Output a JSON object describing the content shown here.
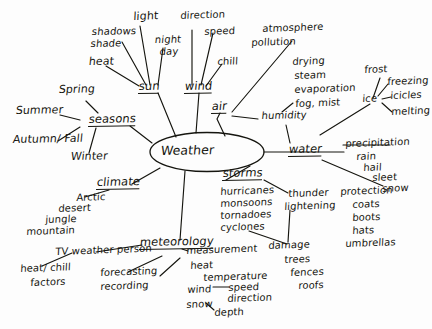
{
  "diagram": {
    "type": "mind-map",
    "title": "Weather",
    "style": "hand-drawn black ink on white paper",
    "center": {
      "label": "Weather",
      "shape": "ellipse"
    },
    "branches": [
      {
        "id": "sun",
        "label": "sun",
        "children": [
          {
            "id": "shadows-shade",
            "label": "shadows\nshade"
          },
          {
            "id": "light",
            "label": "light"
          },
          {
            "id": "night-day",
            "label": "night\nday"
          },
          {
            "id": "heat",
            "label": "heat"
          }
        ]
      },
      {
        "id": "wind",
        "label": "wind",
        "children": [
          {
            "id": "direction",
            "label": "direction"
          },
          {
            "id": "speed",
            "label": "speed"
          },
          {
            "id": "chill",
            "label": "chill"
          }
        ]
      },
      {
        "id": "air",
        "label": "air",
        "children": [
          {
            "id": "atmosphere-pollution",
            "label": "atmosphere\npollution"
          },
          {
            "id": "humidity",
            "label": "humidity"
          }
        ]
      },
      {
        "id": "water",
        "label": "water",
        "children": [
          {
            "id": "drying-steam-evaporation-fog",
            "label": "drying\nsteam\nevaporation\nfog, mist"
          },
          {
            "id": "ice",
            "label": "ice"
          },
          {
            "id": "frost",
            "label": "frost"
          },
          {
            "id": "freezing",
            "label": "freezing"
          },
          {
            "id": "icicles",
            "label": "icicles"
          },
          {
            "id": "melting",
            "label": "melting"
          },
          {
            "id": "precipitation",
            "label": "precipitation\nrain\nhail\nsleet\nsnow"
          },
          {
            "id": "protection",
            "label": "protection\ncoats\nboots\nhats\numbrellas"
          }
        ]
      },
      {
        "id": "storms",
        "label": "storms",
        "children": [
          {
            "id": "storm-types",
            "label": "hurricanes\nmonsoons\ntornadoes\ncyclones"
          },
          {
            "id": "thunder-lightening",
            "label": "thunder\nlightening"
          },
          {
            "id": "damage",
            "label": "damage\ntrees\nfences\nroofs"
          }
        ]
      },
      {
        "id": "seasons",
        "label": "seasons",
        "children": [
          {
            "id": "spring",
            "label": "Spring"
          },
          {
            "id": "summer",
            "label": "Summer"
          },
          {
            "id": "autumn-fall",
            "label": "Autumn/ Fall"
          },
          {
            "id": "winter",
            "label": "Winter"
          }
        ]
      },
      {
        "id": "climate",
        "label": "climate",
        "children": [
          {
            "id": "climate-types",
            "label": "Arctic\ndesert\njungle\nmountain"
          }
        ]
      },
      {
        "id": "meteorology",
        "label": "meteorology",
        "children": [
          {
            "id": "tv-weather-person",
            "label": "TV weather person"
          },
          {
            "id": "heat-chill-factors",
            "label": "heat/ chill\nfactors"
          },
          {
            "id": "forecasting-recording",
            "label": "forecasting\nrecording"
          },
          {
            "id": "measurement",
            "label": "measurement"
          },
          {
            "id": "measure-heat",
            "label": "heat"
          },
          {
            "id": "measure-temperature",
            "label": "temperature"
          },
          {
            "id": "measure-wind",
            "label": "wind"
          },
          {
            "id": "measure-speed",
            "label": "speed"
          },
          {
            "id": "measure-direction",
            "label": "direction"
          },
          {
            "id": "measure-snow",
            "label": "snow"
          },
          {
            "id": "measure-depth",
            "label": "depth"
          }
        ]
      }
    ],
    "labels": {
      "shadows": "shadows",
      "shade": "shade",
      "light": "light",
      "night": "night",
      "day": "day",
      "heat": "heat",
      "sun": "sun",
      "direction": "direction",
      "speed": "speed",
      "chill": "chill",
      "wind": "wind",
      "atmosphere": "atmosphere",
      "pollution": "pollution",
      "air": "air",
      "humidity": "humidity",
      "drying": "drying",
      "steam": "steam",
      "evaporation": "evaporation",
      "fog_mist": "fog, mist",
      "frost": "frost",
      "freezing": "freezing",
      "ice": "ice",
      "icicles": "icicles",
      "melting": "melting",
      "water": "water",
      "precipitation": "precipitation",
      "rain": "rain",
      "hail": "hail",
      "sleet": "sleet",
      "snow": "snow",
      "protection": "protection",
      "coats": "coats",
      "boots": "boots",
      "hats": "hats",
      "umbrellas": "umbrellas",
      "storms": "storms",
      "hurricanes": "hurricanes",
      "monsoons": "monsoons",
      "tornadoes": "tornadoes",
      "cyclones": "cyclones",
      "thunder": "thunder",
      "lightening": "lightening",
      "damage": "damage",
      "trees": "trees",
      "fences": "fences",
      "roofs": "roofs",
      "spring": "Spring",
      "summer": "Summer",
      "autumn_fall": "Autumn/ Fall",
      "winter": "Winter",
      "seasons": "seasons",
      "climate": "climate",
      "arctic": "Arctic",
      "desert": "desert",
      "jungle": "jungle",
      "mountain": "mountain",
      "meteorology": "meteorology",
      "tv_weather_person": "TV weather person",
      "heat_chill": "heat/ chill",
      "factors": "factors",
      "forecasting": "forecasting",
      "recording": "recording",
      "measurement": "measurement",
      "m_heat": "heat",
      "m_temperature": "temperature",
      "m_wind": "wind",
      "m_speed": "speed",
      "m_direction": "direction",
      "m_snow": "snow",
      "m_depth": "depth",
      "weather": "Weather"
    },
    "colors": {
      "ink": "#15150f",
      "paper": "#fdfdfd"
    }
  }
}
